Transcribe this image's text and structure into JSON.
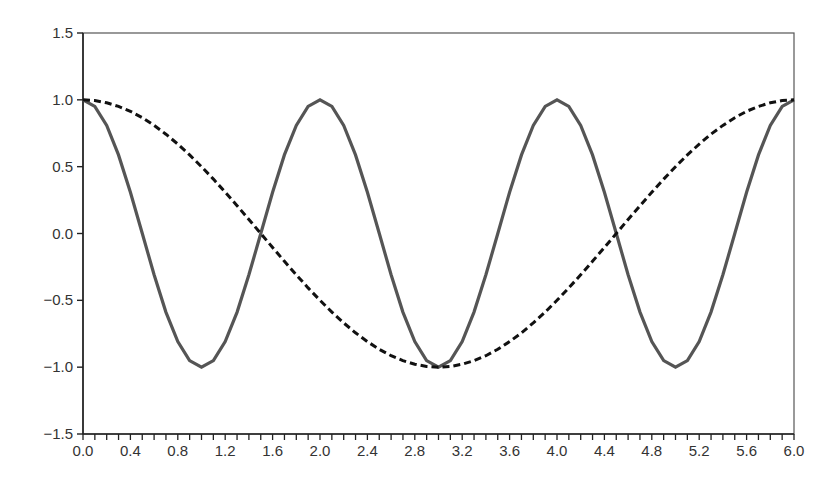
{
  "chart_data": {
    "type": "line",
    "title": "",
    "xlabel": "",
    "ylabel": "",
    "xlim": [
      0.0,
      6.0
    ],
    "ylim": [
      -1.5,
      1.5
    ],
    "grid": false,
    "legend": null,
    "x_ticks": [
      "0.0",
      "0.4",
      "0.8",
      "1.2",
      "1.6",
      "2.0",
      "2.4",
      "2.8",
      "3.2",
      "3.6",
      "4.0",
      "4.4",
      "4.8",
      "5.2",
      "5.6",
      "6.0"
    ],
    "x_tick_values": [
      0.0,
      0.4,
      0.8,
      1.2,
      1.6,
      2.0,
      2.4,
      2.8,
      3.2,
      3.6,
      4.0,
      4.4,
      4.8,
      5.2,
      5.6,
      6.0
    ],
    "x_minor_step": 0.1,
    "y_ticks": [
      "−1.5",
      "−1.0",
      "−0.5",
      "0.0",
      "0.5",
      "1.0",
      "1.5"
    ],
    "y_tick_values": [
      -1.5,
      -1.0,
      -0.5,
      0.0,
      0.5,
      1.0,
      1.5
    ],
    "x": [
      0.0,
      0.1,
      0.2,
      0.3,
      0.4,
      0.5,
      0.6,
      0.7,
      0.8,
      0.9,
      1.0,
      1.1,
      1.2,
      1.3,
      1.4,
      1.5,
      1.6,
      1.7,
      1.8,
      1.9,
      2.0,
      2.1,
      2.2,
      2.3,
      2.4,
      2.5,
      2.6,
      2.7,
      2.8,
      2.9,
      3.0,
      3.1,
      3.2,
      3.3,
      3.4,
      3.5,
      3.6,
      3.7,
      3.8,
      3.9,
      4.0,
      4.1,
      4.2,
      4.3,
      4.4,
      4.5,
      4.6,
      4.7,
      4.8,
      4.9,
      5.0,
      5.1,
      5.2,
      5.3,
      5.4,
      5.5,
      5.6,
      5.7,
      5.8,
      5.9,
      6.0
    ],
    "series": [
      {
        "name": "cos(pi x)",
        "style": "solid",
        "color": "#555555",
        "values": [
          1.0,
          0.951,
          0.809,
          0.588,
          0.309,
          0.0,
          -0.309,
          -0.588,
          -0.809,
          -0.951,
          -1.0,
          -0.951,
          -0.809,
          -0.588,
          -0.309,
          0.0,
          0.309,
          0.588,
          0.809,
          0.951,
          1.0,
          0.951,
          0.809,
          0.588,
          0.309,
          0.0,
          -0.309,
          -0.588,
          -0.809,
          -0.951,
          -1.0,
          -0.951,
          -0.809,
          -0.588,
          -0.309,
          0.0,
          0.309,
          0.588,
          0.809,
          0.951,
          1.0,
          0.951,
          0.809,
          0.588,
          0.309,
          0.0,
          -0.309,
          -0.588,
          -0.809,
          -0.951,
          -1.0,
          -0.951,
          -0.809,
          -0.588,
          -0.309,
          0.0,
          0.309,
          0.588,
          0.809,
          0.951,
          1.0
        ]
      },
      {
        "name": "cos(pi x / 3)",
        "style": "dashed",
        "color": "#111111",
        "values": [
          1.0,
          0.995,
          0.978,
          0.951,
          0.914,
          0.866,
          0.809,
          0.743,
          0.669,
          0.588,
          0.5,
          0.407,
          0.309,
          0.208,
          0.105,
          0.0,
          -0.105,
          -0.208,
          -0.309,
          -0.407,
          -0.5,
          -0.588,
          -0.669,
          -0.743,
          -0.809,
          -0.866,
          -0.914,
          -0.951,
          -0.978,
          -0.995,
          -1.0,
          -0.995,
          -0.978,
          -0.951,
          -0.914,
          -0.866,
          -0.809,
          -0.743,
          -0.669,
          -0.588,
          -0.5,
          -0.407,
          -0.309,
          -0.208,
          -0.105,
          0.0,
          0.105,
          0.208,
          0.309,
          0.407,
          0.5,
          0.588,
          0.669,
          0.743,
          0.809,
          0.866,
          0.914,
          0.951,
          0.978,
          0.995,
          1.0
        ]
      }
    ]
  }
}
